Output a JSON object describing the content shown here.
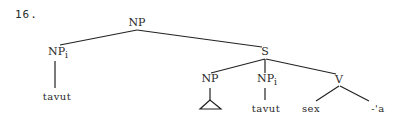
{
  "example_number": "16.",
  "tree": {
    "root": {
      "label": "NP",
      "subscript": ""
    },
    "left_np": {
      "label": "NP",
      "subscript": "i",
      "leaf": "tavut"
    },
    "s": {
      "label": "S"
    },
    "s_children": {
      "np": {
        "label": "NP",
        "subscript": "",
        "leaf_shape": "triangle"
      },
      "np_i": {
        "label": "NP",
        "subscript": "i",
        "leaf": "tavut"
      },
      "v": {
        "label": "V",
        "leaves": [
          "sex",
          "-'a"
        ]
      }
    }
  }
}
